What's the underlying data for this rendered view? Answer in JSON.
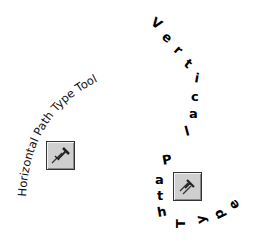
{
  "horizontal_tool": {
    "label": "Horizontal Path Type Tool",
    "icon": "horizontal-path-type-icon"
  },
  "vertical_tool": {
    "label": "Vertical Path Type",
    "letters": [
      "V",
      "e",
      "r",
      "t",
      "i",
      "c",
      "a",
      "l",
      "P",
      "a",
      "t",
      "h",
      "T",
      "y",
      "p",
      "e"
    ],
    "icon": "vertical-path-type-icon"
  },
  "colors": {
    "text": "#000000",
    "icon_bg": "#cfcfcf",
    "icon_border": "#333333"
  }
}
